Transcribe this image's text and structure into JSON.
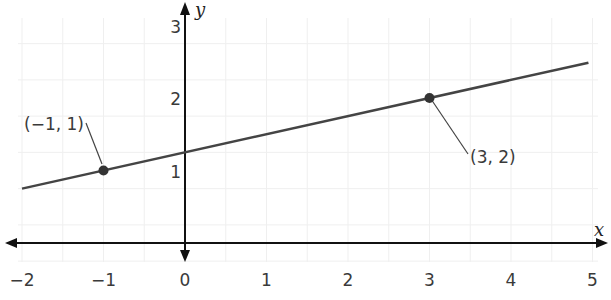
{
  "chart_data": {
    "type": "line",
    "title": "",
    "xlabel": "x",
    "ylabel": "y",
    "xlim": [
      -2.2,
      5.1
    ],
    "ylim": [
      -0.3,
      3.3
    ],
    "grid": true,
    "x_ticks": [
      -2,
      -1,
      0,
      1,
      2,
      3,
      4,
      5
    ],
    "x_tick_labels": [
      "−2",
      "−1",
      "0",
      "1",
      "2",
      "3",
      "4",
      "5"
    ],
    "y_ticks": [
      1,
      2,
      3
    ],
    "y_tick_labels": [
      "1",
      "2",
      "3"
    ],
    "series": [
      {
        "name": "line through (-1,1) and (3,2)",
        "slope": 0.25,
        "intercept": 1.25,
        "x": [
          -2.0,
          4.95
        ],
        "y": [
          0.75,
          2.4875
        ]
      }
    ],
    "points": [
      {
        "x": -1,
        "y": 1,
        "label": "(−1, 1)"
      },
      {
        "x": 3,
        "y": 2,
        "label": "(3, 2)"
      }
    ],
    "colors": {
      "axis": "#111111",
      "line": "#444444",
      "point": "#333333",
      "grid": "#efefef"
    }
  }
}
